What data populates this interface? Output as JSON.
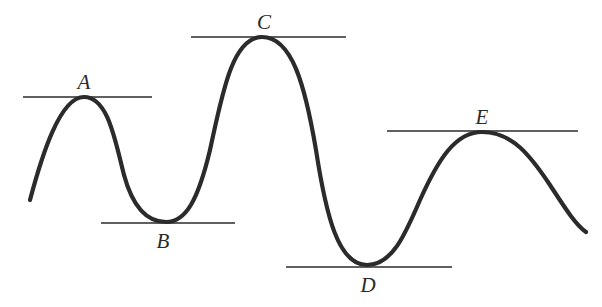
{
  "figure": {
    "type": "potential-energy-style curve with horizontal tangent lines at extrema",
    "colors": {
      "curve": "#2b2b2b",
      "line": "#2b2b2b",
      "background": "#ffffff"
    },
    "points": [
      {
        "id": "A",
        "label": "A",
        "kind": "local maximum",
        "x": 84,
        "y": 97,
        "tangent": {
          "x1": 23,
          "x2": 152,
          "y": 97
        },
        "label_pos": {
          "x": 84,
          "y": 89
        }
      },
      {
        "id": "B",
        "label": "B",
        "kind": "local minimum",
        "x": 166,
        "y": 222,
        "tangent": {
          "x1": 101,
          "x2": 235,
          "y": 223
        },
        "label_pos": {
          "x": 163,
          "y": 248
        }
      },
      {
        "id": "C",
        "label": "C",
        "kind": "global maximum",
        "x": 262,
        "y": 37,
        "tangent": {
          "x1": 191,
          "x2": 346,
          "y": 37
        },
        "label_pos": {
          "x": 264,
          "y": 29
        }
      },
      {
        "id": "D",
        "label": "D",
        "kind": "global minimum",
        "x": 367,
        "y": 265,
        "tangent": {
          "x1": 286,
          "x2": 452,
          "y": 267
        },
        "label_pos": {
          "x": 368,
          "y": 292
        }
      },
      {
        "id": "E",
        "label": "E",
        "kind": "local maximum",
        "x": 482,
        "y": 132,
        "tangent": {
          "x1": 387,
          "x2": 578,
          "y": 131
        },
        "label_pos": {
          "x": 482,
          "y": 124
        }
      }
    ],
    "curve_start": {
      "x": 30,
      "y": 200
    },
    "curve_end": {
      "x": 586,
      "y": 232
    }
  }
}
